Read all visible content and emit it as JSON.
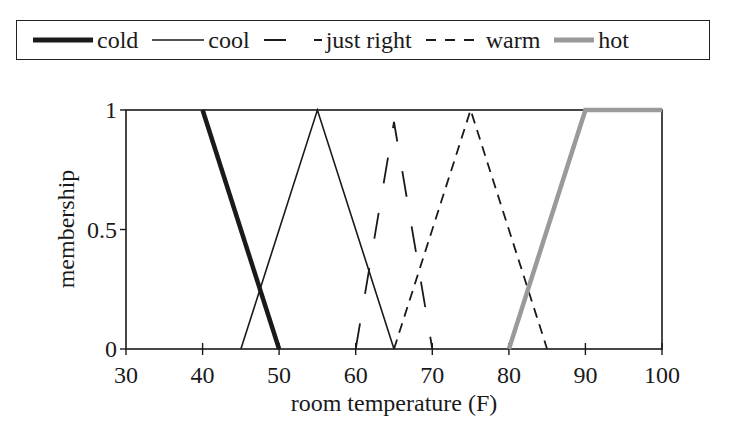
{
  "legend": {
    "items": [
      {
        "label": "cold",
        "style": "thick-solid",
        "color": "#1a1a1a"
      },
      {
        "label": "cool",
        "style": "solid",
        "color": "#1a1a1a"
      },
      {
        "label": "just right",
        "style": "long-dash",
        "color": "#1a1a1a"
      },
      {
        "label": "warm",
        "style": "short-dash",
        "color": "#1a1a1a"
      },
      {
        "label": "hot",
        "style": "thick-solid",
        "color": "#9a9a9a"
      }
    ]
  },
  "axes": {
    "xlabel": "room temperature (F)",
    "ylabel": "membership",
    "xticks": [
      "30",
      "40",
      "50",
      "60",
      "70",
      "80",
      "90",
      "100"
    ],
    "yticks": [
      "0",
      "0.5",
      "1"
    ]
  },
  "chart_data": {
    "type": "line",
    "title": "",
    "xlabel": "room temperature (F)",
    "ylabel": "membership",
    "xlim": [
      30,
      100
    ],
    "ylim": [
      0,
      1
    ],
    "grid": false,
    "legend_position": "top (boxed, above plot)",
    "series": [
      {
        "name": "cold",
        "x": [
          30,
          40,
          50
        ],
        "y": [
          1,
          1,
          0
        ],
        "style": "thick solid black",
        "note": "drawn from 40 (1) to 50 (0)"
      },
      {
        "name": "cool",
        "x": [
          45,
          55,
          65
        ],
        "y": [
          0,
          1,
          0
        ],
        "style": "thin solid black"
      },
      {
        "name": "just right",
        "x": [
          60,
          65,
          70
        ],
        "y": [
          0,
          0.95,
          0
        ],
        "style": "long-dashed black"
      },
      {
        "name": "warm",
        "x": [
          65,
          75,
          85
        ],
        "y": [
          0,
          1,
          0
        ],
        "style": "short-dashed black"
      },
      {
        "name": "hot",
        "x": [
          80,
          90,
          100
        ],
        "y": [
          0,
          1,
          1
        ],
        "style": "thick solid gray"
      }
    ]
  }
}
